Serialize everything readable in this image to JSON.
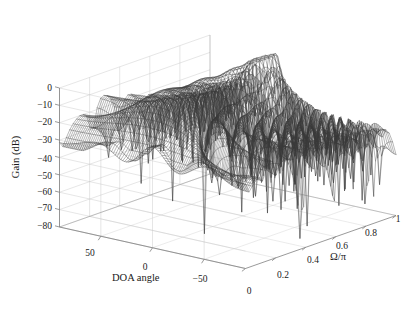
{
  "figure": {
    "kind": "matlab-mesh-3d",
    "background_color": "#ffffff",
    "line_color": "#3a3a3a",
    "grid_color": "#c8c8c8",
    "axis_color": "#808080",
    "text_color": "#1a1a1a",
    "width": 411,
    "height": 313
  },
  "chart_data": {
    "type": "line",
    "render": "wireframe-mesh-surface",
    "title": "",
    "subtitle": "",
    "xlabel": "DOA angle",
    "ylabel": "Ω/π",
    "zlabel": "Gain (dB)",
    "grid": true,
    "legend": null,
    "legend_position": "none",
    "annotations": [],
    "axes": {
      "x": {
        "label": "DOA angle",
        "ticks": [
          50,
          0,
          -50
        ],
        "tick_labels": [
          "50",
          "0",
          "−50"
        ],
        "lim": [
          90,
          -90
        ],
        "direction": "decreasing-left-to-right"
      },
      "y": {
        "label": "Ω/π",
        "ticks": [
          0,
          0.2,
          0.4,
          0.6,
          0.8,
          1
        ],
        "tick_labels": [
          "0",
          "0.2",
          "0.4",
          "0.6",
          "0.8",
          "1"
        ],
        "lim": [
          0,
          1
        ]
      },
      "z": {
        "label": "Gain (dB)",
        "ticks": [
          0,
          -10,
          -20,
          -30,
          -40,
          -50,
          -60,
          -70,
          -80
        ],
        "tick_labels": [
          "0",
          "−10",
          "−20",
          "−30",
          "−40",
          "−50",
          "−60",
          "−70",
          "−80"
        ],
        "lim": [
          -80,
          0
        ]
      }
    },
    "view": {
      "azimuth": -37.5,
      "elevation": 30
    },
    "mesh": {
      "x_samples": 101,
      "y_samples": 45,
      "x_range_deg": [
        -90,
        90
      ],
      "y_range_omega_over_pi": [
        0,
        1
      ],
      "description": "Broadband beamformer gain response: mainlobe plateau near 0 dB for mid/high normalized frequencies, deep sidelobe nulls down to -80 dB, rising ridge at high Omega/pi."
    },
    "model_params": {
      "mainlobe_doa_deg": 20,
      "passband_omega_low": 0.28,
      "passband_omega_high": 0.95,
      "sidelobe_floor_db": -45,
      "null_depth_db": -80,
      "element_count": 14,
      "element_count_high": 22
    }
  },
  "axis_ticks": {
    "z": [
      {
        "label": "0",
        "x": 52,
        "y": 89
      },
      {
        "label": "−10",
        "x": 52,
        "y": 106
      },
      {
        "label": "−20",
        "x": 52,
        "y": 123
      },
      {
        "label": "−30",
        "x": 52,
        "y": 141
      },
      {
        "label": "−40",
        "x": 52,
        "y": 160
      },
      {
        "label": "−50",
        "x": 52,
        "y": 177
      },
      {
        "label": "−60",
        "x": 52,
        "y": 193
      },
      {
        "label": "−70",
        "x": 52,
        "y": 209
      },
      {
        "label": "−80",
        "x": 52,
        "y": 227
      }
    ],
    "x": [
      {
        "label": "50",
        "x": 90,
        "y": 254
      },
      {
        "label": "0",
        "x": 145,
        "y": 268
      },
      {
        "label": "−50",
        "x": 200,
        "y": 280
      }
    ],
    "y": [
      {
        "label": "0",
        "x": 249,
        "y": 292
      },
      {
        "label": "0.2",
        "x": 283,
        "y": 276
      },
      {
        "label": "0.4",
        "x": 313,
        "y": 261
      },
      {
        "label": "0.6",
        "x": 342,
        "y": 247
      },
      {
        "label": "0.8",
        "x": 371,
        "y": 234
      },
      {
        "label": "1",
        "x": 398,
        "y": 220
      }
    ]
  },
  "axis_titles": {
    "z": "Gain (dB)",
    "x": "DOA angle",
    "y": "Ω/π"
  }
}
